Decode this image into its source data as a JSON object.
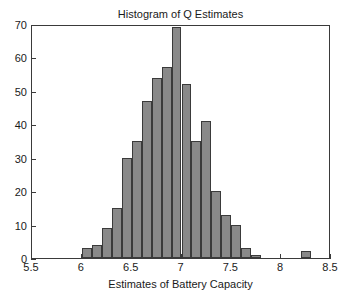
{
  "chart_data": {
    "type": "bar",
    "title": "Histogram of Q Estimates",
    "xlabel": "Estimates of Battery Capacity",
    "ylabel": "",
    "xlim": [
      5.5,
      8.5
    ],
    "ylim": [
      0,
      70
    ],
    "grid": false,
    "legend": null,
    "bin_width": 0.1,
    "xticks": [
      5.5,
      6,
      6.5,
      7,
      7.5,
      8,
      8.5
    ],
    "xtick_labels": [
      "5.5",
      "6",
      "6.5",
      "7",
      "7.5",
      "8",
      "8.5"
    ],
    "yticks": [
      0,
      10,
      20,
      30,
      40,
      50,
      60,
      70
    ],
    "ytick_labels": [
      "0",
      "10",
      "20",
      "30",
      "40",
      "50",
      "60",
      "70"
    ],
    "bin_left_edges": [
      6.0,
      6.1,
      6.2,
      6.3,
      6.4,
      6.5,
      6.6,
      6.7,
      6.8,
      6.9,
      7.0,
      7.1,
      7.2,
      7.3,
      7.4,
      7.5,
      7.6,
      7.7,
      7.8,
      7.9,
      8.2
    ],
    "values": [
      3,
      4,
      9,
      15,
      30,
      35,
      47,
      54,
      57,
      69,
      52,
      35,
      41,
      20,
      13,
      10,
      3,
      1,
      2
    ],
    "bars": [
      {
        "x0": 6.0,
        "x1": 6.1,
        "value": 3
      },
      {
        "x0": 6.1,
        "x1": 6.2,
        "value": 4
      },
      {
        "x0": 6.2,
        "x1": 6.3,
        "value": 9
      },
      {
        "x0": 6.3,
        "x1": 6.4,
        "value": 15
      },
      {
        "x0": 6.4,
        "x1": 6.5,
        "value": 30
      },
      {
        "x0": 6.5,
        "x1": 6.6,
        "value": 35
      },
      {
        "x0": 6.6,
        "x1": 6.7,
        "value": 47
      },
      {
        "x0": 6.7,
        "x1": 6.8,
        "value": 54
      },
      {
        "x0": 6.8,
        "x1": 6.9,
        "value": 57
      },
      {
        "x0": 6.9,
        "x1": 7.0,
        "value": 69
      },
      {
        "x0": 7.0,
        "x1": 7.1,
        "value": 52
      },
      {
        "x0": 7.1,
        "x1": 7.2,
        "value": 35
      },
      {
        "x0": 7.2,
        "x1": 7.3,
        "value": 41
      },
      {
        "x0": 7.3,
        "x1": 7.4,
        "value": 20
      },
      {
        "x0": 7.4,
        "x1": 7.5,
        "value": 13
      },
      {
        "x0": 7.5,
        "x1": 7.6,
        "value": 10
      },
      {
        "x0": 7.6,
        "x1": 7.7,
        "value": 3
      },
      {
        "x0": 7.7,
        "x1": 7.8,
        "value": 1
      },
      {
        "x0": 8.2,
        "x1": 8.3,
        "value": 2
      }
    ],
    "colors": {
      "bar_fill": "#898989",
      "bar_edge": "#3a3a3a",
      "axis": "#3a3a3a",
      "text": "#1a1a1a",
      "background": "#ffffff"
    }
  }
}
